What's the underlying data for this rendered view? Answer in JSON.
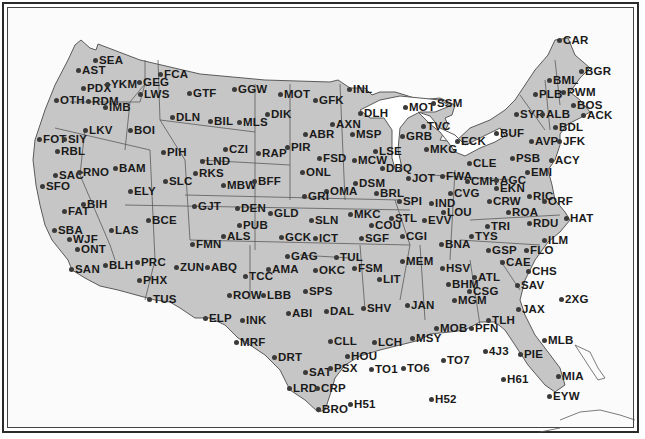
{
  "map": {
    "title": "",
    "colors": {
      "land": "#c6c6c6",
      "water": "#ffffff",
      "border": "#5a5a5a",
      "label": "#1a1a1a",
      "frame": "#2a2a2a"
    },
    "stations": [
      {
        "id": "SEA",
        "x": 96,
        "y": 60
      },
      {
        "id": "AST",
        "x": 79,
        "y": 70
      },
      {
        "id": "PDX",
        "x": 84,
        "y": 88
      },
      {
        "id": "YKM",
        "x": 108,
        "y": 84
      },
      {
        "id": "GEG",
        "x": 140,
        "y": 82
      },
      {
        "id": "FCA",
        "x": 161,
        "y": 74
      },
      {
        "id": "LWS",
        "x": 141,
        "y": 94
      },
      {
        "id": "GTF",
        "x": 190,
        "y": 93
      },
      {
        "id": "OTH",
        "x": 57,
        "y": 100
      },
      {
        "id": "RDM",
        "x": 89,
        "y": 101
      },
      {
        "id": "IMB",
        "x": 106,
        "y": 107
      },
      {
        "id": "DLN",
        "x": 173,
        "y": 117
      },
      {
        "id": "BIL",
        "x": 211,
        "y": 121
      },
      {
        "id": "MLS",
        "x": 240,
        "y": 122
      },
      {
        "id": "DIK",
        "x": 268,
        "y": 114
      },
      {
        "id": "GGW",
        "x": 235,
        "y": 89
      },
      {
        "id": "MOT",
        "x": 281,
        "y": 94
      },
      {
        "id": "GFK",
        "x": 316,
        "y": 100
      },
      {
        "id": "INL",
        "x": 350,
        "y": 89
      },
      {
        "id": "DLH",
        "x": 361,
        "y": 113
      },
      {
        "id": "AXN",
        "x": 333,
        "y": 124
      },
      {
        "id": "MSP",
        "x": 353,
        "y": 134
      },
      {
        "id": "ABR",
        "x": 306,
        "y": 134
      },
      {
        "id": "LKV",
        "x": 86,
        "y": 130
      },
      {
        "id": "BOI",
        "x": 131,
        "y": 130
      },
      {
        "id": "FOT",
        "x": 40,
        "y": 139
      },
      {
        "id": "SIY",
        "x": 65,
        "y": 139
      },
      {
        "id": "RBL",
        "x": 58,
        "y": 151
      },
      {
        "id": "PIH",
        "x": 164,
        "y": 152
      },
      {
        "id": "CZI",
        "x": 226,
        "y": 149
      },
      {
        "id": "RAP",
        "x": 259,
        "y": 153
      },
      {
        "id": "PIR",
        "x": 288,
        "y": 147
      },
      {
        "id": "LND",
        "x": 203,
        "y": 161
      },
      {
        "id": "RKS",
        "x": 196,
        "y": 173
      },
      {
        "id": "MBW",
        "x": 224,
        "y": 185
      },
      {
        "id": "BFF",
        "x": 255,
        "y": 181
      },
      {
        "id": "SAC",
        "x": 56,
        "y": 175
      },
      {
        "id": "RNO",
        "x": 80,
        "y": 172
      },
      {
        "id": "BAM",
        "x": 116,
        "y": 168
      },
      {
        "id": "SLC",
        "x": 166,
        "y": 181
      },
      {
        "id": "SFO",
        "x": 43,
        "y": 186
      },
      {
        "id": "ELY",
        "x": 131,
        "y": 191
      },
      {
        "id": "FSD",
        "x": 320,
        "y": 158
      },
      {
        "id": "MCW",
        "x": 355,
        "y": 160
      },
      {
        "id": "LSE",
        "x": 376,
        "y": 151
      },
      {
        "id": "DBQ",
        "x": 383,
        "y": 168
      },
      {
        "id": "ONL",
        "x": 303,
        "y": 172
      },
      {
        "id": "DSM",
        "x": 356,
        "y": 183
      },
      {
        "id": "OMA",
        "x": 327,
        "y": 191
      },
      {
        "id": "BRL",
        "x": 377,
        "y": 193
      },
      {
        "id": "GRI",
        "x": 305,
        "y": 196
      },
      {
        "id": "MQT",
        "label": "MOT",
        "x": 406,
        "y": 107
      },
      {
        "id": "SSM",
        "x": 434,
        "y": 103
      },
      {
        "id": "TVC",
        "x": 424,
        "y": 126
      },
      {
        "id": "GRB",
        "x": 403,
        "y": 136
      },
      {
        "id": "MKG",
        "x": 427,
        "y": 149
      },
      {
        "id": "ECK",
        "x": 458,
        "y": 141
      },
      {
        "id": "BUF",
        "x": 497,
        "y": 133
      },
      {
        "id": "SYR",
        "x": 517,
        "y": 114
      },
      {
        "id": "ALB",
        "x": 543,
        "y": 114
      },
      {
        "id": "PLB",
        "x": 536,
        "y": 94
      },
      {
        "id": "BML",
        "x": 550,
        "y": 80
      },
      {
        "id": "PWM",
        "x": 564,
        "y": 92
      },
      {
        "id": "BGR",
        "x": 582,
        "y": 71
      },
      {
        "id": "CAR",
        "x": 560,
        "y": 40
      },
      {
        "id": "BOS",
        "x": 574,
        "y": 105
      },
      {
        "id": "ACK",
        "x": 584,
        "y": 115
      },
      {
        "id": "BDL",
        "x": 556,
        "y": 127
      },
      {
        "id": "AVP",
        "x": 532,
        "y": 141
      },
      {
        "id": "JFK",
        "x": 560,
        "y": 141
      },
      {
        "id": "PSB",
        "x": 513,
        "y": 158
      },
      {
        "id": "ACY",
        "x": 552,
        "y": 160
      },
      {
        "id": "EMI",
        "x": 528,
        "y": 172
      },
      {
        "id": "CLE",
        "x": 470,
        "y": 163
      },
      {
        "id": "FWA",
        "x": 443,
        "y": 176
      },
      {
        "id": "CMH",
        "x": 468,
        "y": 181
      },
      {
        "id": "AGC",
        "x": 497,
        "y": 180
      },
      {
        "id": "EKN",
        "x": 497,
        "y": 188
      },
      {
        "id": "RIC",
        "x": 530,
        "y": 196
      },
      {
        "id": "ORF",
        "x": 545,
        "y": 201
      },
      {
        "id": "CVG",
        "x": 451,
        "y": 193
      },
      {
        "id": "CRW",
        "x": 490,
        "y": 201
      },
      {
        "id": "JOT",
        "x": 409,
        "y": 178
      },
      {
        "id": "SPI",
        "x": 400,
        "y": 201
      },
      {
        "id": "IND",
        "x": 432,
        "y": 203
      },
      {
        "id": "LOU",
        "x": 444,
        "y": 212
      },
      {
        "id": "EVV",
        "x": 425,
        "y": 220
      },
      {
        "id": "STL",
        "x": 392,
        "y": 218
      },
      {
        "id": "COU",
        "x": 372,
        "y": 225
      },
      {
        "id": "MKC",
        "x": 351,
        "y": 214
      },
      {
        "id": "ROA",
        "x": 509,
        "y": 212
      },
      {
        "id": "RDU",
        "x": 530,
        "y": 223
      },
      {
        "id": "HAT",
        "x": 567,
        "y": 218
      },
      {
        "id": "TRI",
        "x": 488,
        "y": 226
      },
      {
        "id": "TYS",
        "x": 472,
        "y": 236
      },
      {
        "id": "BNA",
        "x": 442,
        "y": 244
      },
      {
        "id": "CGI",
        "x": 403,
        "y": 236
      },
      {
        "id": "ILM",
        "x": 545,
        "y": 240
      },
      {
        "id": "GSP",
        "x": 489,
        "y": 250
      },
      {
        "id": "FLO",
        "x": 527,
        "y": 250
      },
      {
        "id": "CAE",
        "x": 503,
        "y": 262
      },
      {
        "id": "CHS",
        "x": 529,
        "y": 271
      },
      {
        "id": "SAV",
        "x": 518,
        "y": 285
      },
      {
        "id": "BIH",
        "x": 84,
        "y": 204
      },
      {
        "id": "FAT",
        "x": 65,
        "y": 211
      },
      {
        "id": "BCE",
        "x": 149,
        "y": 220
      },
      {
        "id": "GJT",
        "x": 195,
        "y": 206
      },
      {
        "id": "DEN",
        "x": 238,
        "y": 208
      },
      {
        "id": "GLD",
        "x": 271,
        "y": 213
      },
      {
        "id": "PUB",
        "x": 240,
        "y": 225
      },
      {
        "id": "SLN",
        "x": 312,
        "y": 220
      },
      {
        "id": "ALS",
        "x": 224,
        "y": 236
      },
      {
        "id": "GCK",
        "x": 282,
        "y": 237
      },
      {
        "id": "ICT",
        "x": 316,
        "y": 238
      },
      {
        "id": "SGF",
        "x": 362,
        "y": 238
      },
      {
        "id": "SBA",
        "x": 55,
        "y": 230
      },
      {
        "id": "LAS",
        "x": 112,
        "y": 230
      },
      {
        "id": "WJF",
        "x": 70,
        "y": 239
      },
      {
        "id": "ONT",
        "x": 78,
        "y": 249
      },
      {
        "id": "FMN",
        "x": 193,
        "y": 244
      },
      {
        "id": "SAN",
        "x": 72,
        "y": 269
      },
      {
        "id": "BLH",
        "x": 106,
        "y": 265
      },
      {
        "id": "PRC",
        "x": 138,
        "y": 262
      },
      {
        "id": "ZUN",
        "x": 177,
        "y": 267
      },
      {
        "id": "ABQ",
        "x": 208,
        "y": 267
      },
      {
        "id": "PHX",
        "x": 140,
        "y": 280
      },
      {
        "id": "TUS",
        "x": 150,
        "y": 299
      },
      {
        "id": "TCC",
        "x": 246,
        "y": 276
      },
      {
        "id": "AMA",
        "x": 269,
        "y": 269
      },
      {
        "id": "GAG",
        "x": 288,
        "y": 256
      },
      {
        "id": "OKC",
        "x": 316,
        "y": 270
      },
      {
        "id": "TUL",
        "x": 337,
        "y": 257
      },
      {
        "id": "FSM",
        "x": 355,
        "y": 268
      },
      {
        "id": "LIT",
        "x": 380,
        "y": 279
      },
      {
        "id": "MEM",
        "x": 403,
        "y": 261
      },
      {
        "id": "HSV",
        "x": 443,
        "y": 268
      },
      {
        "id": "ATL",
        "x": 475,
        "y": 277
      },
      {
        "id": "BHM",
        "x": 449,
        "y": 284
      },
      {
        "id": "CSG",
        "x": 470,
        "y": 291
      },
      {
        "id": "MGM",
        "x": 455,
        "y": 300
      },
      {
        "id": "JAX",
        "x": 519,
        "y": 309
      },
      {
        "id": "2XG",
        "x": 562,
        "y": 299
      },
      {
        "id": "ROW",
        "x": 230,
        "y": 295
      },
      {
        "id": "LBB",
        "x": 264,
        "y": 295
      },
      {
        "id": "SPS",
        "x": 306,
        "y": 291
      },
      {
        "id": "ELP",
        "x": 206,
        "y": 318
      },
      {
        "id": "INK",
        "x": 243,
        "y": 320
      },
      {
        "id": "ABI",
        "x": 289,
        "y": 313
      },
      {
        "id": "DAL",
        "x": 327,
        "y": 311
      },
      {
        "id": "SHV",
        "x": 364,
        "y": 308
      },
      {
        "id": "JAN",
        "x": 408,
        "y": 305
      },
      {
        "id": "TLH",
        "x": 489,
        "y": 320
      },
      {
        "id": "MOB",
        "x": 437,
        "y": 328
      },
      {
        "id": "PFN",
        "x": 472,
        "y": 328
      },
      {
        "id": "MSY",
        "x": 413,
        "y": 338
      },
      {
        "id": "MRF",
        "x": 237,
        "y": 342
      },
      {
        "id": "CLL",
        "x": 331,
        "y": 341
      },
      {
        "id": "LCH",
        "x": 375,
        "y": 342
      },
      {
        "id": "HOU",
        "x": 348,
        "y": 356
      },
      {
        "id": "DRT",
        "x": 275,
        "y": 357
      },
      {
        "id": "MLB",
        "x": 545,
        "y": 340
      },
      {
        "id": "4J3",
        "x": 486,
        "y": 351
      },
      {
        "id": "PIE",
        "x": 521,
        "y": 354
      },
      {
        "id": "TO7",
        "x": 444,
        "y": 360
      },
      {
        "id": "SAT",
        "x": 306,
        "y": 372
      },
      {
        "id": "PSX",
        "x": 331,
        "y": 368
      },
      {
        "id": "TO1",
        "x": 372,
        "y": 369
      },
      {
        "id": "TO6",
        "x": 404,
        "y": 368
      },
      {
        "id": "H61",
        "x": 504,
        "y": 379
      },
      {
        "id": "MIA",
        "x": 559,
        "y": 376
      },
      {
        "id": "LRD",
        "x": 290,
        "y": 388
      },
      {
        "id": "CRP",
        "x": 318,
        "y": 388
      },
      {
        "id": "BRO",
        "x": 319,
        "y": 409
      },
      {
        "id": "H51",
        "x": 351,
        "y": 404
      },
      {
        "id": "H52",
        "x": 432,
        "y": 399
      },
      {
        "id": "EYW",
        "x": 550,
        "y": 396
      }
    ]
  }
}
